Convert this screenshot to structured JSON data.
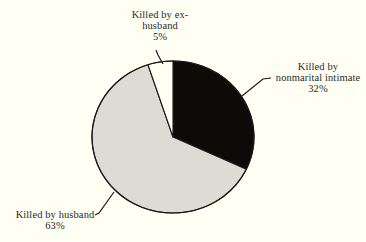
{
  "chart_data": {
    "type": "pie",
    "title": "",
    "start_angle_deg": 0,
    "direction": "clockwise",
    "slices": [
      {
        "label": "Killed by nonmarital intimate",
        "value": 32,
        "color": "#0d0a08"
      },
      {
        "label": "Killed by husband",
        "value": 63,
        "color": "#dcdcd4"
      },
      {
        "label": "Killed by ex-husband",
        "value": 5,
        "color": "#fffff4"
      }
    ],
    "categories": [
      "Killed by nonmarital intimate",
      "Killed by husband",
      "Killed by ex-husband"
    ],
    "values": [
      32,
      63,
      5
    ],
    "unit": "%"
  },
  "labels": {
    "ex_husband": {
      "line1": "Killed by ex-",
      "line2": "husband",
      "pct": "5%"
    },
    "nonmarital": {
      "line1": "Killed by",
      "line2": "nonmarital intimate",
      "pct": "32%"
    },
    "husband": {
      "line1": "Killed by husband",
      "pct": "63%"
    }
  },
  "style": {
    "background": "#fffff4",
    "outline": "#1a1a1a"
  }
}
